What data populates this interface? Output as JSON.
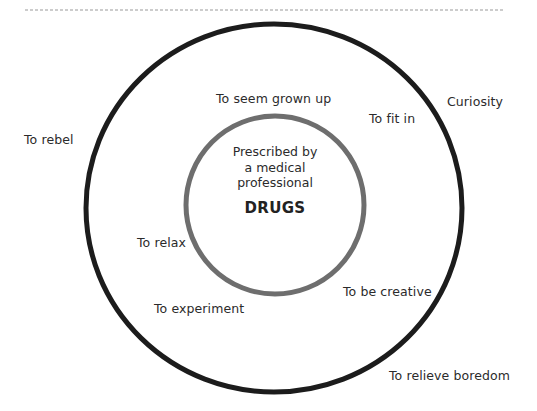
{
  "diagram": {
    "type": "concentric-circles",
    "colors": {
      "outer_circle": "#1c1c1c",
      "inner_circle": "#6e6e6e",
      "dotted_rule": "#9a9a9a",
      "text": "#2b2b2b"
    },
    "center": {
      "subtitle_lines": [
        "Prescribed by",
        "a medical",
        "professional"
      ],
      "title": "DRUGS"
    },
    "reasons": {
      "seem_grown_up": "To seem grown up",
      "fit_in": "To fit in",
      "curiosity": "Curiosity",
      "rebel": "To rebel",
      "relax": "To relax",
      "be_creative": "To be creative",
      "experiment": "To experiment",
      "relieve_boredom": "To relieve boredom"
    }
  }
}
